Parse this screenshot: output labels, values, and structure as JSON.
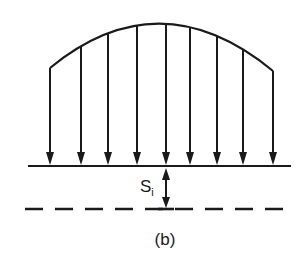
{
  "figure": {
    "caption": "(b)",
    "stroke_color": "#1a1a1a",
    "background": "#ffffff"
  },
  "load_curve": {
    "description": "parabolic distributed load acting downward",
    "start": [
      50,
      68
    ],
    "peak": [
      160,
      21
    ],
    "end": [
      273,
      71
    ]
  },
  "arrows": {
    "count": 9,
    "x_positions": [
      50,
      81,
      108,
      137,
      166,
      190,
      217,
      243,
      273
    ],
    "direction": "down",
    "target_y": 166
  },
  "baseline": {
    "y": 166,
    "x1": 28,
    "x2": 291,
    "style": "solid"
  },
  "reference_line": {
    "y": 209,
    "x1": 25,
    "x2": 291,
    "style": "dashed"
  },
  "settlement": {
    "label_main": "S",
    "label_sub": "i",
    "x": 166,
    "y_top": 166,
    "y_bottom": 209
  }
}
